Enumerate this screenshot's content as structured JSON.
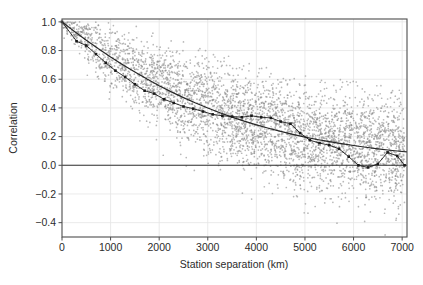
{
  "chart_data": {
    "type": "scatter",
    "title": "",
    "xlabel": "Station separation (km)",
    "ylabel": "Correlation",
    "xlim": [
      0,
      7100
    ],
    "ylim": [
      -0.5,
      1.02
    ],
    "xticks": [
      0,
      1000,
      2000,
      3000,
      4000,
      5000,
      6000,
      7000
    ],
    "xticklabels": [
      "0",
      "1000",
      "2000",
      "3000",
      "4000",
      "5000",
      "6000",
      "7000"
    ],
    "yticks": [
      -0.4,
      -0.2,
      0.0,
      0.2,
      0.4,
      0.6,
      0.8,
      1.0
    ],
    "yticklabels": [
      "-0.4",
      "-0.2",
      "0.0",
      "0.2",
      "0.4",
      "0.6",
      "0.8",
      "1.0"
    ],
    "grid": true,
    "grid_color": "#e4e4e4",
    "legend": null,
    "zero_line": {
      "y": 0.0,
      "color": "#333333",
      "width": 1.1
    },
    "series": [
      {
        "name": "station-pair scatter",
        "type": "scatter",
        "color": "#8c8c8c",
        "marker": "dot",
        "marker_size": 0.85,
        "n_points": 4200,
        "description": "Cloud of individual station-pair correlations decaying with separation",
        "note": "Point cloud generated along the decay envelope; spread widens with separation"
      },
      {
        "name": "fitted exponential decay",
        "type": "line",
        "color": "#262626",
        "width": 1.2,
        "x": [
          0,
          250,
          500,
          750,
          1000,
          1250,
          1500,
          1750,
          2000,
          2250,
          2500,
          2750,
          3000,
          3250,
          3500,
          3750,
          4000,
          4250,
          4500,
          4750,
          5000,
          5250,
          5500,
          5750,
          6000,
          6250,
          6500,
          6750,
          7000,
          7100
        ],
        "y": [
          1.0,
          0.935,
          0.872,
          0.812,
          0.755,
          0.701,
          0.65,
          0.601,
          0.555,
          0.512,
          0.472,
          0.434,
          0.399,
          0.366,
          0.336,
          0.308,
          0.282,
          0.258,
          0.236,
          0.216,
          0.197,
          0.18,
          0.165,
          0.151,
          0.138,
          0.126,
          0.115,
          0.105,
          0.096,
          0.093
        ]
      },
      {
        "name": "binned mean correlation",
        "type": "line-markers",
        "color": "#1a1a1a",
        "width": 0.9,
        "marker": "square",
        "marker_size": 2.6,
        "x": [
          0,
          300,
          500,
          700,
          900,
          1100,
          1300,
          1500,
          1700,
          1900,
          2100,
          2300,
          2500,
          2700,
          2900,
          3100,
          3300,
          3500,
          3700,
          3900,
          4100,
          4300,
          4500,
          4700,
          4900,
          5100,
          5300,
          5500,
          5700,
          5900,
          6100,
          6300,
          6500,
          6700,
          6900,
          7050
        ],
        "y": [
          1.0,
          0.865,
          0.835,
          0.775,
          0.715,
          0.66,
          0.615,
          0.565,
          0.52,
          0.5,
          0.46,
          0.435,
          0.41,
          0.395,
          0.375,
          0.355,
          0.345,
          0.34,
          0.335,
          0.345,
          0.335,
          0.33,
          0.305,
          0.29,
          0.225,
          0.175,
          0.155,
          0.14,
          0.115,
          0.06,
          0.0,
          -0.015,
          0.01,
          0.09,
          0.065,
          0.0
        ]
      }
    ]
  },
  "axes": {
    "frame_color": "#4d4d4d",
    "background": "#ffffff"
  }
}
